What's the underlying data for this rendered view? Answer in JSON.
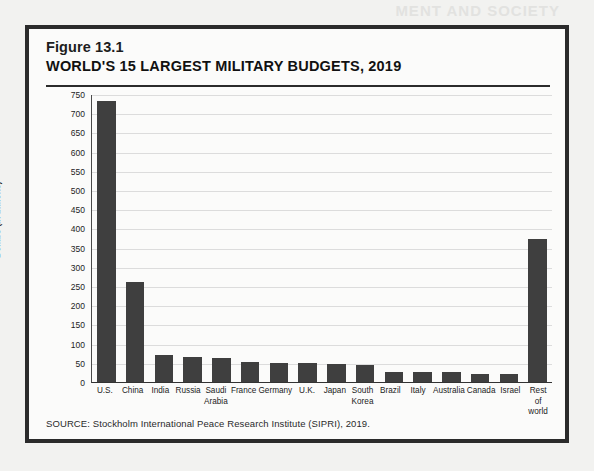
{
  "figure": {
    "label": "Figure 13.1",
    "title": "WORLD'S 15 LARGEST MILITARY BUDGETS, 2019",
    "source": "SOURCE: Stockholm International Peace Research Institute (SIPRI), 2019."
  },
  "artifacts": {
    "bleed_line_1": "MENT AND SOCIETY",
    "bleed_line_2": "AND SOCIETY",
    "bleed_line_3": "Democracies in the United States"
  },
  "colors": {
    "bar": "#3f3f3f",
    "border": "#2b2b2b",
    "page": "#f2f2f0",
    "panel": "#fbfbfa",
    "grid": "#dcdcdc"
  },
  "chart_data": {
    "type": "bar",
    "title": "WORLD'S 15 LARGEST MILITARY BUDGETS, 2019",
    "xlabel": "",
    "ylabel": "Dollars (in billions)",
    "ylim": [
      0,
      750
    ],
    "ytick_step": 50,
    "yticks": [
      750,
      700,
      650,
      600,
      550,
      500,
      450,
      400,
      350,
      300,
      250,
      200,
      150,
      100,
      50,
      0
    ],
    "grid": true,
    "legend": false,
    "categories": [
      "U.S.",
      "China",
      "India",
      "Russia",
      "Saudi Arabia",
      "France",
      "Germany",
      "U.K.",
      "Japan",
      "South Korea",
      "Brazil",
      "Italy",
      "Australia",
      "Canada",
      "Israel",
      "Rest of world"
    ],
    "values": [
      732,
      261,
      71,
      65,
      62,
      51,
      49,
      49,
      48,
      44,
      27,
      27,
      26,
      22,
      20,
      372
    ]
  }
}
